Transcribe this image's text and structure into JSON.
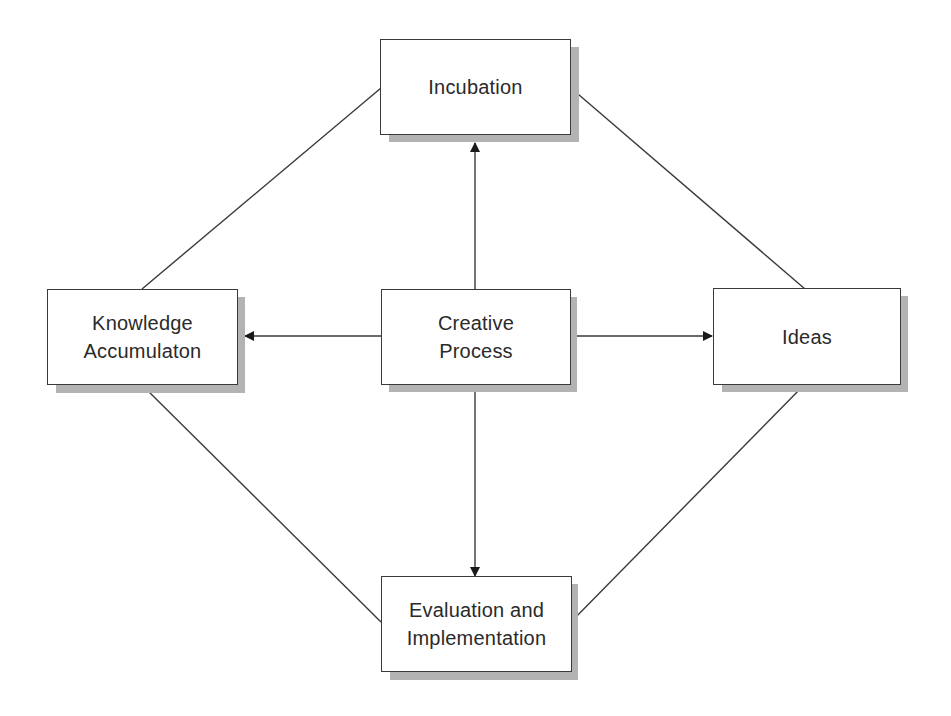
{
  "diagram": {
    "type": "concept-flow",
    "center": {
      "id": "creative",
      "label": "Creative\nProcess"
    },
    "nodes": {
      "incubation": {
        "label": "Incubation"
      },
      "knowledge": {
        "label": "Knowledge\nAccumulaton"
      },
      "ideas": {
        "label": "Ideas"
      },
      "evaluation": {
        "label": "Evaluation and\nImplementation"
      }
    },
    "arrows": [
      {
        "from": "creative",
        "to": "incubation",
        "direction": "up"
      },
      {
        "from": "creative",
        "to": "knowledge",
        "direction": "left"
      },
      {
        "from": "creative",
        "to": "ideas",
        "direction": "right"
      },
      {
        "from": "creative",
        "to": "evaluation",
        "direction": "down"
      }
    ],
    "links": [
      {
        "from": "knowledge",
        "to": "incubation"
      },
      {
        "from": "incubation",
        "to": "ideas"
      },
      {
        "from": "knowledge",
        "to": "evaluation"
      },
      {
        "from": "ideas",
        "to": "evaluation"
      }
    ],
    "colors": {
      "border": "#3a3a3a",
      "shadow": "#b3b3b3",
      "text": "#2a2a2a",
      "background": "#ffffff"
    }
  }
}
